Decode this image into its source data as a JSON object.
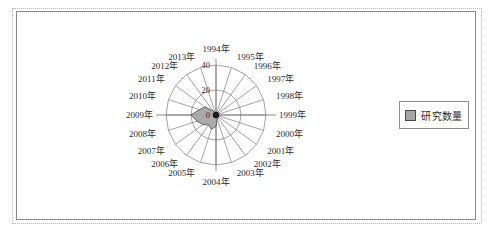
{
  "figure": {
    "legend": {
      "label": "研究数量",
      "swatch_color": "#a6a6a6",
      "swatch_border": "#4a4a4a"
    },
    "frame": {
      "outer_style": "dotted",
      "inner_style": "solid",
      "outer_color": "#b9b9b9",
      "inner_color": "#8a8a8a"
    }
  },
  "chart_data": {
    "type": "area",
    "subtype": "polar-radar",
    "title": "",
    "xlabel": "",
    "ylabel": "",
    "rlim": [
      0,
      40
    ],
    "r_ticks": [
      0,
      20,
      40
    ],
    "r_tick_labels": [
      "0",
      "20",
      "40"
    ],
    "grid": true,
    "legend_position": "right",
    "start_angle_deg": 90,
    "direction": "clockwise",
    "categories": [
      "1994年",
      "1995年",
      "1996年",
      "1997年",
      "1998年",
      "1999年",
      "2000年",
      "2001年",
      "2002年",
      "2003年",
      "2004年",
      "2005年",
      "2006年",
      "2007年",
      "2008年",
      "2009年",
      "2010年",
      "2011年",
      "2012年",
      "2013年"
    ],
    "series": [
      {
        "name": "研究数量",
        "color": "#a6a6a6",
        "border_color": "#4a4a4a",
        "values": [
          1,
          0,
          0,
          0,
          1,
          1,
          1,
          2,
          2,
          3,
          9,
          12,
          10,
          13,
          16,
          20,
          14,
          11,
          4,
          2
        ]
      }
    ]
  }
}
